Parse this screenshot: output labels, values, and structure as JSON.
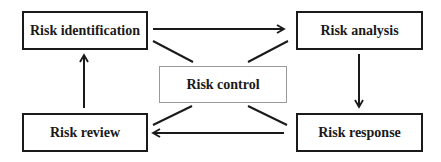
{
  "diagram": {
    "type": "risk-management-cycle",
    "nodes": {
      "identification": {
        "label": "Risk identification"
      },
      "analysis": {
        "label": "Risk analysis"
      },
      "response": {
        "label": "Risk response"
      },
      "review": {
        "label": "Risk review"
      },
      "control": {
        "label": "Risk control"
      }
    },
    "edges": [
      {
        "from": "Risk identification",
        "to": "Risk analysis",
        "style": "arrow"
      },
      {
        "from": "Risk analysis",
        "to": "Risk response",
        "style": "arrow"
      },
      {
        "from": "Risk response",
        "to": "Risk review",
        "style": "arrow"
      },
      {
        "from": "Risk review",
        "to": "Risk identification",
        "style": "arrow"
      },
      {
        "from": "Risk control",
        "to": "Risk identification",
        "style": "line"
      },
      {
        "from": "Risk control",
        "to": "Risk analysis",
        "style": "line"
      },
      {
        "from": "Risk control",
        "to": "Risk response",
        "style": "line"
      },
      {
        "from": "Risk control",
        "to": "Risk review",
        "style": "line"
      }
    ],
    "colors": {
      "stroke": "#1a1a1a",
      "center_border": "#9a9a9a",
      "background": "#ffffff"
    }
  }
}
